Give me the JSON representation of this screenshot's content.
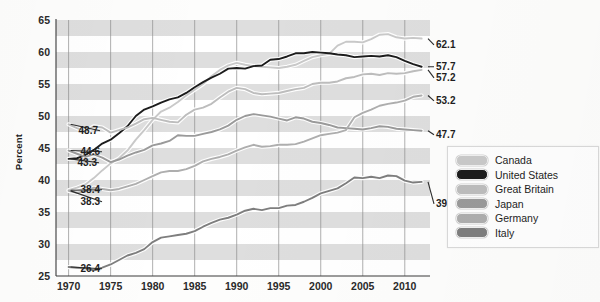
{
  "chart_data": {
    "type": "line",
    "title": "",
    "xlabel": "",
    "ylabel": "Percent",
    "xlim": [
      1968.5,
      2013.0
    ],
    "ylim": [
      25,
      65
    ],
    "grid": "vertical-gridlines-and-horizontal-alternating-bands",
    "legend_position": "right-middle",
    "x_ticks": [
      1970,
      1975,
      1980,
      1985,
      1990,
      1995,
      2000,
      2005,
      2010
    ],
    "y_ticks": [
      25,
      30,
      35,
      40,
      45,
      50,
      55,
      60,
      65
    ],
    "start_labels": [
      "48.7",
      "44.6",
      "43.3",
      "38.4",
      "38.3",
      "26.4"
    ],
    "end_labels": [
      "62.1",
      "57.7",
      "57.2",
      "53.2",
      "47.7",
      "39.7"
    ],
    "series": [
      {
        "name": "Canada",
        "color": "#c9c9c9",
        "start_value": 38.4,
        "end_value": 62.1,
        "x": [
          1970,
          1971,
          1972,
          1973,
          1974,
          1975,
          1976,
          1977,
          1978,
          1979,
          1980,
          1981,
          1982,
          1983,
          1984,
          1985,
          1986,
          1987,
          1988,
          1989,
          1990,
          1991,
          1992,
          1993,
          1994,
          1995,
          1996,
          1997,
          1998,
          1999,
          2000,
          2001,
          2002,
          2003,
          2004,
          2005,
          2006,
          2007,
          2008,
          2009,
          2010,
          2011,
          2012
        ],
        "values": [
          38.4,
          38.8,
          39.3,
          40.3,
          41.5,
          42.6,
          43.4,
          44.6,
          46.3,
          47.8,
          49.4,
          50.7,
          51.3,
          52.2,
          53.2,
          54.1,
          55.0,
          56.2,
          57.2,
          57.9,
          58.3,
          58.0,
          57.8,
          57.7,
          57.6,
          57.5,
          57.7,
          58.0,
          58.6,
          59.2,
          59.5,
          59.7,
          61.0,
          61.6,
          61.6,
          61.5,
          62.0,
          62.7,
          62.8,
          62.3,
          62.1,
          62.2,
          62.1
        ]
      },
      {
        "name": "United States",
        "color": "#1c1c1c",
        "start_value": 43.3,
        "end_value": 57.7,
        "x": [
          1970,
          1971,
          1972,
          1973,
          1974,
          1975,
          1976,
          1977,
          1978,
          1979,
          1980,
          1981,
          1982,
          1983,
          1984,
          1985,
          1986,
          1987,
          1988,
          1989,
          1990,
          1991,
          1992,
          1993,
          1994,
          1995,
          1996,
          1997,
          1998,
          1999,
          2000,
          2001,
          2002,
          2003,
          2004,
          2005,
          2006,
          2007,
          2008,
          2009,
          2010,
          2011,
          2012
        ],
        "values": [
          43.3,
          43.4,
          43.9,
          44.7,
          45.7,
          46.3,
          47.3,
          48.4,
          50.0,
          51.0,
          51.5,
          52.1,
          52.6,
          52.9,
          53.6,
          54.5,
          55.3,
          56.0,
          56.6,
          57.4,
          57.5,
          57.4,
          57.8,
          57.9,
          58.8,
          58.9,
          59.3,
          59.8,
          59.8,
          60.0,
          59.9,
          59.8,
          59.6,
          59.5,
          59.2,
          59.3,
          59.4,
          59.3,
          59.5,
          59.2,
          58.6,
          58.1,
          57.7
        ]
      },
      {
        "name": "Great Britain",
        "color": "#bdbdbd",
        "start_value": 48.7,
        "end_value": 57.2,
        "x": [
          1970,
          1971,
          1972,
          1973,
          1974,
          1975,
          1976,
          1977,
          1978,
          1979,
          1980,
          1981,
          1982,
          1983,
          1984,
          1985,
          1986,
          1987,
          1988,
          1989,
          1990,
          1991,
          1992,
          1993,
          1994,
          1995,
          1996,
          1997,
          1998,
          1999,
          2000,
          2001,
          2002,
          2003,
          2004,
          2005,
          2006,
          2007,
          2008,
          2009,
          2010,
          2011,
          2012
        ],
        "values": [
          48.7,
          48.1,
          47.6,
          48.4,
          48.2,
          47.4,
          47.8,
          48.2,
          48.8,
          49.5,
          49.7,
          49.4,
          49.1,
          49.0,
          50.2,
          51.0,
          51.3,
          51.9,
          52.9,
          53.8,
          54.4,
          54.2,
          53.6,
          53.4,
          53.5,
          53.6,
          53.9,
          54.2,
          54.4,
          55.0,
          55.2,
          55.2,
          55.4,
          55.9,
          56.1,
          56.5,
          56.6,
          56.4,
          56.7,
          56.6,
          56.7,
          57.0,
          57.2
        ]
      },
      {
        "name": "Japan",
        "color": "#9a9a9a",
        "start_value": 44.6,
        "end_value": 47.7,
        "x": [
          1970,
          1971,
          1972,
          1973,
          1974,
          1975,
          1976,
          1977,
          1978,
          1979,
          1980,
          1981,
          1982,
          1983,
          1984,
          1985,
          1986,
          1987,
          1988,
          1989,
          1990,
          1991,
          1992,
          1993,
          1994,
          1995,
          1996,
          1997,
          1998,
          1999,
          2000,
          2001,
          2002,
          2003,
          2004,
          2005,
          2006,
          2007,
          2008,
          2009,
          2010,
          2011,
          2012
        ],
        "values": [
          44.6,
          44.1,
          43.6,
          44.0,
          43.5,
          42.8,
          43.2,
          43.8,
          44.3,
          44.7,
          45.4,
          45.7,
          46.1,
          47.0,
          46.9,
          46.9,
          47.2,
          47.5,
          47.9,
          48.5,
          49.4,
          50.0,
          50.3,
          50.1,
          49.9,
          49.6,
          49.3,
          49.8,
          49.6,
          49.1,
          48.9,
          48.6,
          48.2,
          48.1,
          48.0,
          47.9,
          48.1,
          48.4,
          48.3,
          48.0,
          47.9,
          47.8,
          47.7
        ]
      },
      {
        "name": "Germany",
        "color": "#aeaeae",
        "start_value": 38.3,
        "end_value": 53.2,
        "x": [
          1970,
          1971,
          1972,
          1973,
          1974,
          1975,
          1976,
          1977,
          1978,
          1979,
          1980,
          1981,
          1982,
          1983,
          1984,
          1985,
          1986,
          1987,
          1988,
          1989,
          1990,
          1991,
          1992,
          1993,
          1994,
          1995,
          1996,
          1997,
          1998,
          1999,
          2000,
          2001,
          2002,
          2003,
          2004,
          2005,
          2006,
          2007,
          2008,
          2009,
          2010,
          2011,
          2012
        ],
        "values": [
          38.3,
          38.0,
          38.2,
          38.8,
          38.6,
          38.4,
          38.6,
          39.0,
          39.4,
          40.0,
          40.6,
          41.2,
          41.4,
          41.4,
          41.7,
          42.2,
          42.9,
          43.3,
          43.6,
          44.0,
          44.6,
          45.1,
          45.5,
          45.2,
          45.3,
          45.5,
          45.5,
          45.6,
          46.0,
          46.5,
          47.0,
          47.2,
          47.4,
          47.8,
          49.8,
          50.5,
          51.0,
          51.6,
          51.9,
          52.1,
          52.4,
          53.0,
          53.2
        ]
      },
      {
        "name": "Italy",
        "color": "#7e7e7e",
        "start_value": 26.4,
        "end_value": 39.7,
        "x": [
          1970,
          1971,
          1972,
          1973,
          1974,
          1975,
          1976,
          1977,
          1978,
          1979,
          1980,
          1981,
          1982,
          1983,
          1984,
          1985,
          1986,
          1987,
          1988,
          1989,
          1990,
          1991,
          1992,
          1993,
          1994,
          1995,
          1996,
          1997,
          1998,
          1999,
          2000,
          2001,
          2002,
          2003,
          2004,
          2005,
          2006,
          2007,
          2008,
          2009,
          2010,
          2011,
          2012
        ],
        "values": [
          26.4,
          26.3,
          26.2,
          25.9,
          26.3,
          26.8,
          27.5,
          28.2,
          28.6,
          29.2,
          30.3,
          31.0,
          31.2,
          31.4,
          31.6,
          32.0,
          32.7,
          33.3,
          33.8,
          34.1,
          34.6,
          35.2,
          35.5,
          35.3,
          35.6,
          35.6,
          36.0,
          36.1,
          36.6,
          37.2,
          37.9,
          38.3,
          38.7,
          39.5,
          40.4,
          40.3,
          40.5,
          40.3,
          40.7,
          40.6,
          39.9,
          39.6,
          39.7
        ]
      }
    ]
  },
  "legend": {
    "items": [
      {
        "label": "Canada"
      },
      {
        "label": "United States"
      },
      {
        "label": "Great Britain"
      },
      {
        "label": "Japan"
      },
      {
        "label": "Germany"
      },
      {
        "label": "Italy"
      }
    ]
  },
  "axis": {
    "y_title": "Percent"
  }
}
